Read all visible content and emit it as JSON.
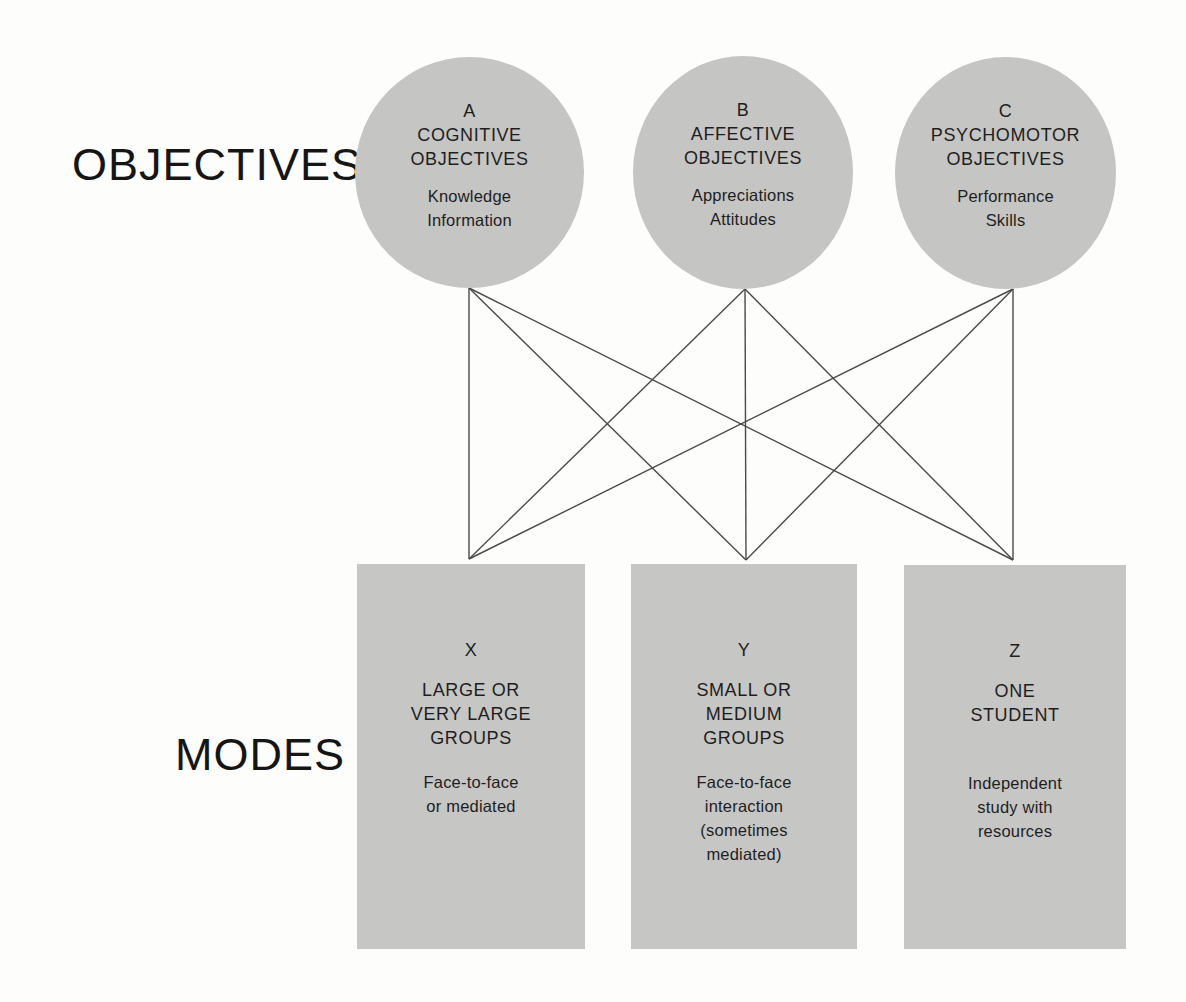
{
  "labels": {
    "objectives": "OBJECTIVES",
    "modes": "MODES"
  },
  "objectives": [
    {
      "letter": "A",
      "title": [
        "COGNITIVE",
        "OBJECTIVES"
      ],
      "sub": [
        "Knowledge",
        "Information"
      ]
    },
    {
      "letter": "B",
      "title": [
        "AFFECTIVE",
        "OBJECTIVES"
      ],
      "sub": [
        "Appreciations",
        "Attitudes"
      ]
    },
    {
      "letter": "C",
      "title": [
        "PSYCHOMOTOR",
        "OBJECTIVES"
      ],
      "sub": [
        "Performance",
        "Skills"
      ]
    }
  ],
  "modes": [
    {
      "letter": "X",
      "title": [
        "LARGE OR",
        "VERY LARGE",
        "GROUPS"
      ],
      "sub": [
        "Face-to-face",
        "or mediated"
      ]
    },
    {
      "letter": "Y",
      "title": [
        "SMALL OR",
        "MEDIUM",
        "GROUPS"
      ],
      "sub": [
        "Face-to-face",
        "interaction",
        "(sometimes",
        "mediated)"
      ]
    },
    {
      "letter": "Z",
      "title": [
        "ONE",
        "STUDENT"
      ],
      "sub": [
        "Independent",
        "study with",
        "resources"
      ]
    }
  ],
  "connections": "every objective (A, B, C) connects to every mode (X, Y, Z)",
  "colors": {
    "shape_fill": "#c5c5c4",
    "line": "#4a4a4a",
    "text": "#1e1e1e",
    "background": "#fdfdfc"
  }
}
